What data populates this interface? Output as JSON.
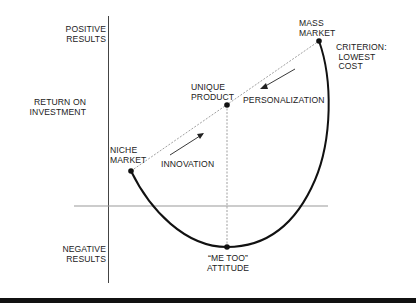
{
  "diagram": {
    "axis_labels": {
      "positive": "POSITIVE\nRESULTS",
      "y_axis": "RETURN ON\nINVESTMENT",
      "negative": "NEGATIVE\nRESULTS"
    },
    "points": {
      "niche_market": "NICHE\nMARKET",
      "unique_product": "UNIQUE\nPRODUCT",
      "mass_market": "MASS\nMARKET",
      "me_too": "“ME TOO”\nATTITUDE"
    },
    "annotations": {
      "criterion": "CRITERION:\n LOWEST\n COST",
      "innovation": "INNOVATION",
      "personalization": "PERSONALIZATION"
    },
    "colors": {
      "curve": "#111111",
      "axis": "#444444",
      "horizontal_axis": "#999999",
      "dashed": "#777777"
    }
  }
}
